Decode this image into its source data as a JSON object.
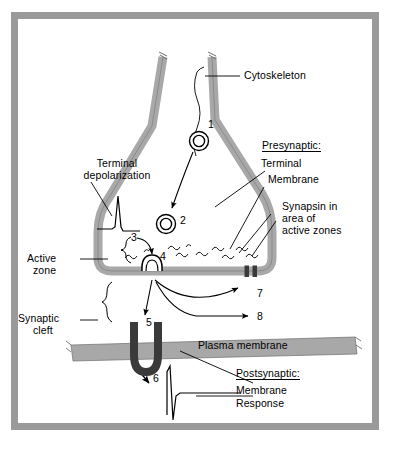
{
  "figure": {
    "page_bg": "#ffffff",
    "frame_color": "#9a9a9a",
    "membrane_fill": "#a8a8a8",
    "membrane_stroke": "#555555",
    "dark_channel": "#3a3a3a",
    "ink": "#000000"
  },
  "labels": {
    "cytoskeleton": "Cytoskeleton",
    "presynaptic_heading": "Presynaptic:",
    "presynaptic_terminal": "Terminal",
    "presynaptic_membrane": "Membrane",
    "synapsin_line1": "Synapsin in",
    "synapsin_line2": "area of",
    "synapsin_line3": "active zones",
    "terminal_depol_line1": "Terminal",
    "terminal_depol_line2": "depolarization",
    "active_zone_line1": "Active",
    "active_zone_line2": "zone",
    "synaptic_cleft_line1": "Synaptic",
    "synaptic_cleft_line2": "cleft",
    "plasma_membrane": "Plasma membrane",
    "postsynaptic_heading": "Postsynaptic:",
    "postsynaptic_membrane": "Membrane",
    "postsynaptic_response": "Response"
  },
  "callouts": [
    {
      "id": "1",
      "text": "1",
      "meaning": "vesicle-transport-along-cytoskeleton"
    },
    {
      "id": "2",
      "text": "2",
      "meaning": "vesicle-in-reserve-pool"
    },
    {
      "id": "3",
      "text": "3",
      "meaning": "vesicle-mobilization"
    },
    {
      "id": "4",
      "text": "4",
      "meaning": "vesicle-docking-at-active-zone"
    },
    {
      "id": "5",
      "text": "5",
      "meaning": "transmitter-receptor-binding"
    },
    {
      "id": "6",
      "text": "6",
      "meaning": "postsynaptic-membrane-response"
    },
    {
      "id": "7",
      "text": "7",
      "meaning": "membrane-retrieval-endocytosis"
    },
    {
      "id": "8",
      "text": "8",
      "meaning": "vesicle-recycling-pathway"
    }
  ],
  "icon_names": [
    "synaptic-vesicle-icon",
    "cytoskeleton-filament-icon",
    "synapsin-squiggle-icon",
    "action-potential-spike-icon",
    "epsp-waveform-icon",
    "receptor-channel-icon",
    "curly-brace-icon",
    "arrow-icon"
  ]
}
